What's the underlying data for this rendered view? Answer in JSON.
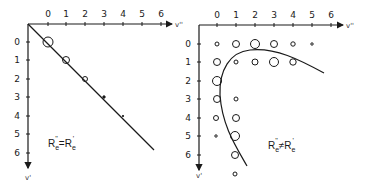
{
  "colors": {
    "ink": "#1a1a1a",
    "background": "#ffffff"
  },
  "left_panel": {
    "x_axis_label": "v''",
    "y_axis_label": "v'",
    "x_ticks": [
      "0",
      "1",
      "2",
      "3",
      "4",
      "5",
      "6"
    ],
    "y_ticks": [
      "0",
      "1",
      "2",
      "3",
      "4",
      "5",
      "6"
    ],
    "equation": {
      "lhs": "R",
      "lhs_sub": "e",
      "lhs_sup": "''",
      "op": "=",
      "rhs": "R",
      "rhs_sub": "e",
      "rhs_sup": "'"
    },
    "points": [
      {
        "v_upper": 0,
        "v_lower": 0,
        "size": "large"
      },
      {
        "v_upper": 1,
        "v_lower": 1,
        "size": "medium"
      },
      {
        "v_upper": 2,
        "v_lower": 2,
        "size": "small"
      },
      {
        "v_upper": 3,
        "v_lower": 3,
        "size": "dot"
      },
      {
        "v_upper": 4,
        "v_lower": 4,
        "size": "tiny-dot"
      }
    ]
  },
  "right_panel": {
    "x_axis_label": "v''",
    "y_axis_label": "v'",
    "x_ticks": [
      "0",
      "1",
      "2",
      "3",
      "4",
      "5",
      "6"
    ],
    "y_ticks": [
      "0",
      "1",
      "2",
      "3",
      "4",
      "5",
      "6"
    ],
    "equation": {
      "lhs": "R",
      "lhs_sub": "e",
      "lhs_sup": "''",
      "op": "≠",
      "rhs": "R",
      "rhs_sub": "e",
      "rhs_sup": "'"
    },
    "points": [
      {
        "v_upper": 0,
        "v_lower": 0,
        "size": "small"
      },
      {
        "v_upper": 1,
        "v_lower": 0,
        "size": "medium"
      },
      {
        "v_upper": 2,
        "v_lower": 0,
        "size": "large"
      },
      {
        "v_upper": 3,
        "v_lower": 0,
        "size": "medium"
      },
      {
        "v_upper": 4,
        "v_lower": 0,
        "size": "small"
      },
      {
        "v_upper": 5,
        "v_lower": 0,
        "size": "tiny"
      },
      {
        "v_upper": 0,
        "v_lower": 1,
        "size": "medium"
      },
      {
        "v_upper": 1,
        "v_lower": 1,
        "size": "small"
      },
      {
        "v_upper": 2,
        "v_lower": 1,
        "size": "medium"
      },
      {
        "v_upper": 3,
        "v_lower": 1,
        "size": "large"
      },
      {
        "v_upper": 4,
        "v_lower": 1,
        "size": "medium"
      },
      {
        "v_upper": 0,
        "v_lower": 2,
        "size": "large"
      },
      {
        "v_upper": 0,
        "v_lower": 3,
        "size": "medium"
      },
      {
        "v_upper": 1,
        "v_lower": 3,
        "size": "small"
      },
      {
        "v_upper": 0,
        "v_lower": 4,
        "size": "small"
      },
      {
        "v_upper": 1,
        "v_lower": 4,
        "size": "medium"
      },
      {
        "v_upper": 0,
        "v_lower": 5,
        "size": "tiny"
      },
      {
        "v_upper": 1,
        "v_lower": 5,
        "size": "large"
      },
      {
        "v_upper": 1,
        "v_lower": 6,
        "size": "medium"
      },
      {
        "v_upper": 1,
        "v_lower": 7,
        "size": "small"
      }
    ]
  }
}
